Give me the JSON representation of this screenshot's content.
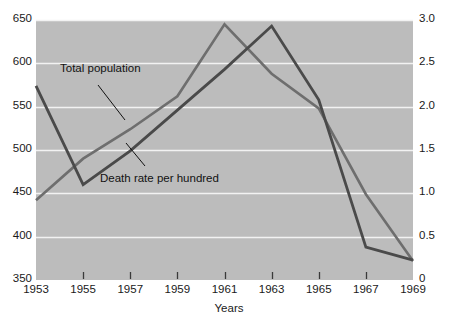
{
  "chart_data": {
    "type": "line",
    "title": "",
    "xlabel": "Years",
    "ylabel_left": "",
    "ylabel_right": "",
    "x": [
      1953,
      1954,
      1955,
      1956,
      1957,
      1958,
      1959,
      1960,
      1961,
      1962,
      1963,
      1964,
      1965,
      1966,
      1967,
      1968,
      1969
    ],
    "categories": [
      "1953",
      "1955",
      "1957",
      "1959",
      "1961",
      "1963",
      "1965",
      "1967",
      "1969"
    ],
    "xticklabels": [
      "1953",
      "1955",
      "1957",
      "1959",
      "1961",
      "1963",
      "1965",
      "1967",
      "1969"
    ],
    "xlim": [
      1953,
      1969
    ],
    "grid": true,
    "gridlines": "horizontal",
    "legend_position": "inline-annotations",
    "plot_background": "#bcbcbc",
    "gridline_color": "#f2f2f2",
    "left_axis": {
      "ticklabels": [
        "350",
        "400",
        "450",
        "500",
        "550",
        "600",
        "650"
      ],
      "values": [
        350,
        400,
        450,
        500,
        550,
        600,
        650
      ],
      "ylim": [
        350,
        650
      ]
    },
    "right_axis": {
      "ticklabels": [
        "0",
        "0.5",
        "1.0",
        "1.5",
        "2.0",
        "2.5",
        "3.0"
      ],
      "values": [
        0,
        0.5,
        1.0,
        1.5,
        2.0,
        2.5,
        3.0
      ],
      "ylim": [
        0,
        3.0
      ]
    },
    "series": [
      {
        "name": "Total population",
        "axis": "left",
        "color": "#6e6e6e",
        "annotation": "Total population",
        "unit": "thousands",
        "points": [
          {
            "x": 1953,
            "y": 442
          },
          {
            "x": 1955,
            "y": 490
          },
          {
            "x": 1957,
            "y": 524
          },
          {
            "x": 1959,
            "y": 562
          },
          {
            "x": 1961,
            "y": 645
          },
          {
            "x": 1963,
            "y": 588
          },
          {
            "x": 1965,
            "y": 548
          },
          {
            "x": 1967,
            "y": 449
          },
          {
            "x": 1969,
            "y": 372
          }
        ],
        "values": [
          442,
          490,
          524,
          562,
          645,
          588,
          548,
          449,
          372
        ]
      },
      {
        "name": "Death rate per hundred",
        "axis": "right",
        "color": "#4a4a4a",
        "annotation": "Death rate per hundred",
        "unit": "per hundred",
        "points": [
          {
            "x": 1953,
            "y": 2.24
          },
          {
            "x": 1955,
            "y": 1.1
          },
          {
            "x": 1957,
            "y": 1.49
          },
          {
            "x": 1959,
            "y": 1.96
          },
          {
            "x": 1961,
            "y": 2.43
          },
          {
            "x": 1963,
            "y": 2.93
          },
          {
            "x": 1965,
            "y": 2.08
          },
          {
            "x": 1967,
            "y": 0.38
          },
          {
            "x": 1969,
            "y": 0.23
          }
        ],
        "values": [
          2.24,
          1.1,
          1.49,
          1.96,
          2.43,
          2.93,
          2.08,
          0.38,
          0.23
        ]
      }
    ],
    "annotations": [
      {
        "text": "Total population",
        "target_series": "Total population"
      },
      {
        "text": "Death rate per hundred",
        "target_series": "Death rate per hundred"
      }
    ]
  }
}
